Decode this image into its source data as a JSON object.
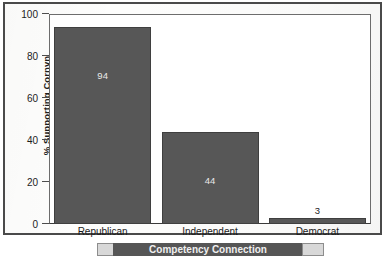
{
  "figure": {
    "y_axis_title": "% Supporting Cornyn",
    "caption": "Competency Connection",
    "bar_color": "#575757",
    "frame_color": "#4a4a4a",
    "background": "#ffffff"
  },
  "chart_data": {
    "type": "bar",
    "title": "",
    "xlabel": "",
    "ylabel": "% Supporting Cornyn",
    "categories": [
      "Republican",
      "Independent",
      "Democrat"
    ],
    "values": [
      94,
      44,
      3
    ],
    "value_labels": [
      "94",
      "44",
      "3"
    ],
    "ylim": [
      0,
      100
    ],
    "yticks": [
      0,
      20,
      40,
      60,
      80,
      100
    ],
    "ytick_labels": [
      "0",
      "20",
      "40",
      "60",
      "80",
      "100"
    ],
    "grid": false,
    "legend": null,
    "series": [
      {
        "name": "% Supporting Cornyn",
        "values": [
          94,
          44,
          3
        ]
      }
    ]
  }
}
